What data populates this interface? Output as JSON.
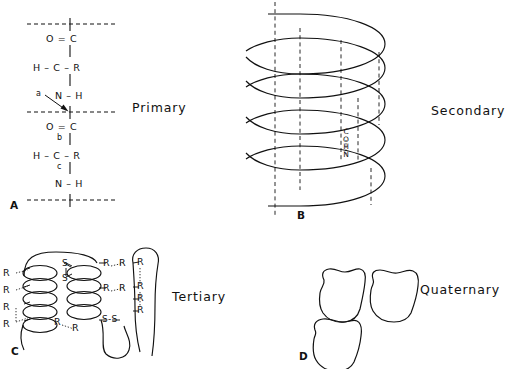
{
  "figure": {
    "caption_levels": [
      "Primary",
      "Secondary",
      "Tertiary",
      "Quaternary"
    ]
  },
  "panel_a": {
    "letter": "A",
    "level_label": "Primary",
    "residue_1": {
      "carbonyl": "O = C",
      "alpha": "H – C – R",
      "amide": "N – H"
    },
    "residue_2": {
      "carbonyl": "O = C",
      "alpha": "H – C – R",
      "amide": "N – H"
    },
    "bond_labels": {
      "a": "a",
      "b": "b",
      "c": "c"
    }
  },
  "panel_b": {
    "letter": "B",
    "level_label": "Secondary",
    "hbond_atoms": [
      "C",
      "O",
      "H",
      "N"
    ],
    "hbond_notation": "C=O···H-N",
    "helix_turns": 5
  },
  "panel_c": {
    "letter": "C",
    "level_label": "Tertiary",
    "side_chain_label": "R",
    "disulfide_label": "S-S",
    "sulfur_label": "S",
    "r_group_count": 14,
    "disulfide_count": 2
  },
  "panel_d": {
    "letter": "D",
    "level_label": "Quaternary",
    "subunit_count": 3
  }
}
